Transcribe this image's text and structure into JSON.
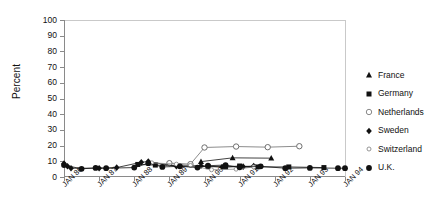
{
  "chart_data": {
    "type": "line",
    "title": "",
    "xlabel": "",
    "ylabel": "Percent",
    "ylim": [
      0,
      100
    ],
    "yticks": [
      0,
      10,
      20,
      30,
      40,
      50,
      60,
      70,
      80,
      90,
      100
    ],
    "grid": false,
    "legend_position": "right",
    "categories": [
      "JAN 86",
      "JAN 87",
      "JAN 88",
      "JAN 89",
      "JAN 90",
      "JAN 91",
      "JAN 92",
      "JAN 93",
      "JAN 94"
    ],
    "x_tick_labels": [
      "JAN 86",
      "JAN 87",
      "JAN 88",
      "JAN 89",
      "JAN 90",
      "JAN 91",
      "JAN 92",
      "JAN 93",
      "JAN 94"
    ],
    "series": [
      {
        "name": "France",
        "marker": "filled-triangle",
        "color": "#111111",
        "points": [
          {
            "x": 1989.9,
            "y": 9.8
          },
          {
            "x": 1990.8,
            "y": 12.2
          },
          {
            "x": 1991.9,
            "y": 12.0
          }
        ]
      },
      {
        "name": "Germany",
        "marker": "filled-square",
        "color": "#111111",
        "points": [
          {
            "x": 1988.1,
            "y": 8.0
          },
          {
            "x": 1988.6,
            "y": 7.6
          },
          {
            "x": 1990.1,
            "y": 6.6
          },
          {
            "x": 1990.6,
            "y": 6.4
          },
          {
            "x": 1991.0,
            "y": 7.0
          },
          {
            "x": 1991.5,
            "y": 6.4
          },
          {
            "x": 1992.4,
            "y": 6.4
          },
          {
            "x": 1993.4,
            "y": 6.0
          }
        ]
      },
      {
        "name": "Netherlands",
        "marker": "open-circle",
        "color": "#6e6e6e",
        "points": [
          {
            "x": 1989.0,
            "y": 8.8
          },
          {
            "x": 1989.6,
            "y": 8.2
          },
          {
            "x": 1990.0,
            "y": 18.8
          },
          {
            "x": 1990.9,
            "y": 19.4
          },
          {
            "x": 1991.8,
            "y": 19.0
          },
          {
            "x": 1992.7,
            "y": 19.6
          }
        ]
      },
      {
        "name": "Sweden",
        "marker": "filled-diamond",
        "color": "#111111",
        "points": [
          {
            "x": 1986.0,
            "y": 8.6
          },
          {
            "x": 1986.1,
            "y": 6.8
          },
          {
            "x": 1986.2,
            "y": 5.6
          },
          {
            "x": 1987.0,
            "y": 5.6
          },
          {
            "x": 1987.5,
            "y": 6.0
          },
          {
            "x": 1988.2,
            "y": 9.4
          },
          {
            "x": 1988.4,
            "y": 9.8
          },
          {
            "x": 1989.2,
            "y": 6.8
          },
          {
            "x": 1989.9,
            "y": 7.2
          },
          {
            "x": 1990.5,
            "y": 6.4
          },
          {
            "x": 1991.1,
            "y": 6.6
          },
          {
            "x": 1991.4,
            "y": 7.0
          }
        ]
      },
      {
        "name": "Switzerland",
        "marker": "open-circle-small",
        "color": "#8a8a8a",
        "points": [
          {
            "x": 1988.5,
            "y": 9.0
          },
          {
            "x": 1989.2,
            "y": 8.2
          },
          {
            "x": 1989.6,
            "y": 7.4
          },
          {
            "x": 1990.2,
            "y": 4.6
          },
          {
            "x": 1990.9,
            "y": 5.0
          },
          {
            "x": 1991.4,
            "y": 6.4
          }
        ]
      },
      {
        "name": "U.K.",
        "marker": "filled-circle",
        "color": "#111111",
        "points": [
          {
            "x": 1986.0,
            "y": 7.6
          },
          {
            "x": 1986.5,
            "y": 5.2
          },
          {
            "x": 1986.9,
            "y": 5.8
          },
          {
            "x": 1987.2,
            "y": 5.6
          },
          {
            "x": 1988.0,
            "y": 6.0
          },
          {
            "x": 1988.4,
            "y": 8.8
          },
          {
            "x": 1988.8,
            "y": 6.4
          },
          {
            "x": 1989.3,
            "y": 6.8
          },
          {
            "x": 1989.8,
            "y": 6.0
          },
          {
            "x": 1990.1,
            "y": 7.2
          },
          {
            "x": 1990.6,
            "y": 7.6
          },
          {
            "x": 1991.0,
            "y": 6.2
          },
          {
            "x": 1991.6,
            "y": 6.8
          },
          {
            "x": 1992.3,
            "y": 5.6
          },
          {
            "x": 1993.0,
            "y": 5.8
          },
          {
            "x": 1993.8,
            "y": 5.6
          },
          {
            "x": 1994.0,
            "y": 5.6
          }
        ]
      }
    ]
  },
  "legend": {
    "items": [
      {
        "label": "France",
        "marker": "filled-triangle"
      },
      {
        "label": "Germany",
        "marker": "filled-square"
      },
      {
        "label": "Netherlands",
        "marker": "open-circle"
      },
      {
        "label": "Sweden",
        "marker": "filled-diamond"
      },
      {
        "label": "Switzerland",
        "marker": "open-circle-small"
      },
      {
        "label": "U.K.",
        "marker": "filled-circle"
      }
    ]
  },
  "colors": {
    "axis": "#8a8a8a",
    "frame": "#c9c9c9",
    "text": "#111111",
    "series_dark": "#111111",
    "series_gray": "#6e6e6e"
  }
}
